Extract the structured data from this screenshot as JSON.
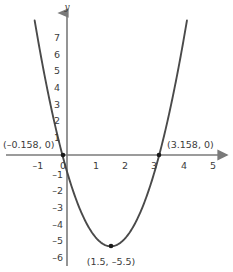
{
  "chart_data": {
    "type": "line",
    "title": "",
    "xlabel": "",
    "ylabel": "y",
    "axis_names": {
      "x": "",
      "y": "y"
    },
    "xlim": [
      -1.6,
      5.6
    ],
    "ylim": [
      -7.0,
      8.0
    ],
    "grid": false,
    "legend": null,
    "function": "y = x^2 - 3x - 0.5",
    "series": [
      {
        "name": "parabola",
        "color": "#4a4a4a",
        "x": [
          -1.02,
          -0.9,
          -0.8,
          -0.7,
          -0.6,
          -0.5,
          -0.4,
          -0.3,
          -0.2,
          -0.158,
          -0.1,
          0,
          0.2,
          0.4,
          0.6,
          0.8,
          1.0,
          1.2,
          1.4,
          1.5,
          1.6,
          1.8,
          2.0,
          2.2,
          2.4,
          2.6,
          2.8,
          3.0,
          3.158,
          3.2,
          3.4,
          3.6,
          3.8,
          4.0,
          4.05
        ],
        "y": [
          7.6,
          7.0,
          5.66,
          4.43,
          3.31,
          2.3,
          1.4,
          0.61,
          -0.07,
          -0.2,
          -0.5,
          -1.0,
          -1.83,
          -2.52,
          -3.07,
          -3.48,
          -3.75,
          -3.88,
          -3.87,
          -5.5,
          -3.73,
          -3.3,
          -2.73,
          -2.02,
          -1.17,
          -0.18,
          0.95,
          2.22,
          3.4,
          3.64,
          5.2,
          6.9,
          8.7,
          10.6,
          11.0
        ]
      }
    ],
    "x_ticks": [
      {
        "value": -1,
        "label": "–1"
      },
      {
        "value": 0,
        "label": "0"
      },
      {
        "value": 1,
        "label": "1"
      },
      {
        "value": 2,
        "label": "2"
      },
      {
        "value": 3,
        "label": "3"
      },
      {
        "value": 4,
        "label": "4"
      },
      {
        "value": 5,
        "label": "5"
      }
    ],
    "y_ticks": [
      {
        "value": 7,
        "label": "7"
      },
      {
        "value": 6,
        "label": "6"
      },
      {
        "value": 5,
        "label": "5"
      },
      {
        "value": 4,
        "label": "4"
      },
      {
        "value": 3,
        "label": "3"
      },
      {
        "value": 2,
        "label": "2"
      },
      {
        "value": 1,
        "label": "1"
      },
      {
        "value": -1,
        "label": "–1"
      },
      {
        "value": -2,
        "label": "–2"
      },
      {
        "value": -3,
        "label": "–3"
      },
      {
        "value": -4,
        "label": "–4"
      },
      {
        "value": -5,
        "label": "–5"
      },
      {
        "value": -6,
        "label": "–6"
      }
    ],
    "annotations": [
      {
        "name": "left-root",
        "label": "(–0.158, 0)",
        "x": -0.158,
        "y": 0,
        "marker": true
      },
      {
        "name": "right-root",
        "label": "(3.158, 0)",
        "x": 3.158,
        "y": 0,
        "marker": true
      },
      {
        "name": "vertex",
        "label": "(1.5, –5.5)",
        "x": 1.5,
        "y": -5.5,
        "marker": true
      }
    ],
    "colors": {
      "curve": "#4a4a4a",
      "axis": "#7a7a7a",
      "text": "#3c3c3c",
      "marker": "#1a1a1a",
      "background": "#ffffff"
    }
  },
  "labels": {
    "y_axis_name": "y",
    "left_root": "(–0.158, 0)",
    "right_root": "(3.158, 0)",
    "vertex": "(1.5, –5.5)",
    "x_tick_neg1": "–1",
    "x_tick_0": "0",
    "x_tick_1": "1",
    "x_tick_2": "2",
    "x_tick_3": "3",
    "x_tick_4": "4",
    "x_tick_5": "5",
    "y_tick_7": "7",
    "y_tick_6": "6",
    "y_tick_5": "5",
    "y_tick_4": "4",
    "y_tick_3": "3",
    "y_tick_2": "2",
    "y_tick_1": "1",
    "y_tick_neg1": "–1",
    "y_tick_neg2": "–2",
    "y_tick_neg3": "–3",
    "y_tick_neg4": "–4",
    "y_tick_neg5": "–5",
    "y_tick_neg6": "–6"
  }
}
